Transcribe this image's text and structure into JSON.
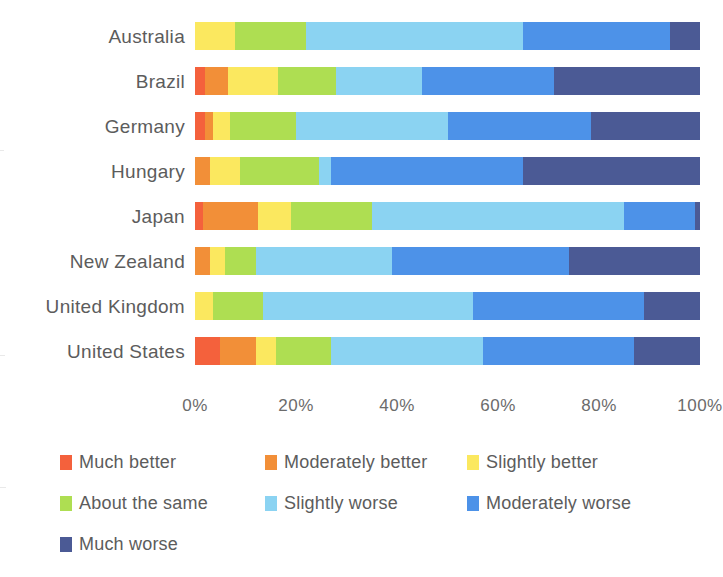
{
  "chart_data": {
    "type": "bar",
    "title": "",
    "subtitle": "",
    "xlabel": "",
    "ylabel": "",
    "orientation": "horizontal",
    "stacked": true,
    "stack_mode": "percent",
    "grid": false,
    "legend_position": "bottom",
    "xlim": [
      0,
      100
    ],
    "x_ticks": [
      0,
      20,
      40,
      60,
      80,
      100
    ],
    "x_tick_labels": [
      "0%",
      "20%",
      "40%",
      "60%",
      "80%",
      "100%"
    ],
    "categories": [
      "Australia",
      "Brazil",
      "Germany",
      "Hungary",
      "Japan",
      "New Zealand",
      "United Kingdom",
      "United States"
    ],
    "series": [
      {
        "name": "Much better",
        "color": "#f4613c",
        "values": [
          0,
          2,
          2,
          0,
          1.5,
          0,
          0,
          5
        ]
      },
      {
        "name": "Moderately better",
        "color": "#f28f38",
        "values": [
          0,
          4.5,
          1.5,
          3,
          11,
          3,
          0,
          7
        ]
      },
      {
        "name": "Slightly better",
        "color": "#fbe85f",
        "values": [
          8,
          10,
          3.5,
          6,
          6.5,
          3,
          3.5,
          4
        ]
      },
      {
        "name": "About the same",
        "color": "#aede52",
        "values": [
          14,
          11.5,
          13,
          15.5,
          16,
          6,
          10,
          11
        ]
      },
      {
        "name": "Slightly worse",
        "color": "#8bd3f2",
        "values": [
          43,
          17,
          30,
          2.5,
          50,
          27,
          41.5,
          30
        ]
      },
      {
        "name": "Moderately worse",
        "color": "#4d92e8",
        "values": [
          29,
          26,
          28.5,
          38,
          14,
          35,
          34,
          30
        ]
      },
      {
        "name": "Much worse",
        "color": "#4b5a95",
        "values": [
          6,
          29,
          21.5,
          35,
          1,
          26,
          11,
          13
        ]
      }
    ]
  },
  "legend": {
    "items": [
      {
        "label": "Much better",
        "color": "#f4613c"
      },
      {
        "label": "Moderately better",
        "color": "#f28f38"
      },
      {
        "label": "Slightly better",
        "color": "#fbe85f"
      },
      {
        "label": "About the same",
        "color": "#aede52"
      },
      {
        "label": "Slightly worse",
        "color": "#8bd3f2"
      },
      {
        "label": "Moderately worse",
        "color": "#4d92e8"
      },
      {
        "label": "Much worse",
        "color": "#4b5a95"
      }
    ]
  }
}
